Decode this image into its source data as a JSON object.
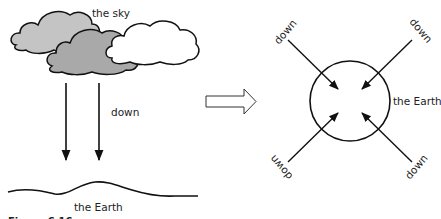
{
  "left_panel": {
    "sky_label": "the sky",
    "down_label": "down",
    "earth_label": "the Earth",
    "clouds": [
      {
        "name": "light-gray-cloud",
        "fill": "#c4c4c4"
      },
      {
        "name": "dark-gray-cloud",
        "fill": "#a9a9a9"
      },
      {
        "name": "white-cloud",
        "fill": "#ffffff"
      }
    ]
  },
  "transition_arrow": {
    "style": "hollow"
  },
  "right_panel": {
    "earth_label": "the Earth",
    "arrows": [
      {
        "position": "top-left",
        "label": "down"
      },
      {
        "position": "top-right",
        "label": "down"
      },
      {
        "position": "bottom-left",
        "label": "down"
      },
      {
        "position": "bottom-right",
        "label": "down"
      }
    ]
  },
  "caption": {
    "text": "Figure 6.16"
  }
}
